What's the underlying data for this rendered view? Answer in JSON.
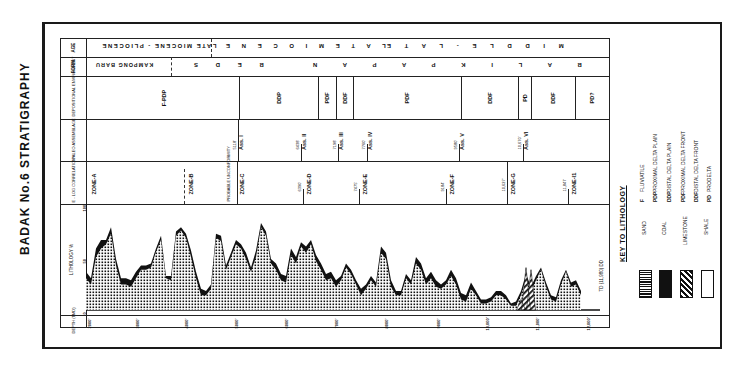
{
  "title": "BADAK No.6 STRATIGRAPHY",
  "row_headers": {
    "age": "AGE",
    "form": "FORM",
    "dep_env": "DEPOSITIONAL ENVIRONMENT",
    "paleo": "PALEO ASSEMBLAGE",
    "elog": "E - LOG CORRELATION",
    "lithology": "LITHOLOGY %",
    "depth": "DEPTH (TMD)"
  },
  "age_row": {
    "pliocene": "LATE MIOCENE - PLIOCENE",
    "late_miocene": "L A T E   M I O C E N E",
    "middle_late_miocene": "M I D D L E  -  L A T E"
  },
  "form_row": {
    "kampong_baru": "KAMPONG BARU",
    "beds": "B  E  D  S",
    "balikpapan": "B A L I K P A P A N"
  },
  "dep_env": [
    {
      "label": "F-PDP"
    },
    {
      "label": "DDP"
    },
    {
      "label": "PDF"
    },
    {
      "label": "DDF"
    },
    {
      "label": "PDF"
    },
    {
      "label": "DDF"
    },
    {
      "label": "PD"
    },
    {
      "label": "DDF"
    },
    {
      "label": "PD?"
    }
  ],
  "paleo": [
    {
      "depth": "5118'",
      "label": "Ass. I"
    },
    {
      "depth": "6438'",
      "label": "Ass. II"
    },
    {
      "depth": "7198'",
      "label": "Ass. III"
    },
    {
      "depth": "7760'",
      "label": "Ass. IV"
    },
    {
      "depth": "9580'",
      "label": "Ass. V"
    },
    {
      "depth": "10,670'",
      "label": "Ass. VI"
    }
  ],
  "zones": [
    {
      "depth": "",
      "label": "ZONE-A"
    },
    {
      "depth": "",
      "label": "ZONE-B"
    },
    {
      "depth": "PROBABLE UNCONFORMITY",
      "label": "ZONE-C"
    },
    {
      "depth": "6390'",
      "label": "ZONE-D"
    },
    {
      "depth": "7475'",
      "label": "ZONE-E"
    },
    {
      "depth": "9184'",
      "label": "ZONE-F"
    },
    {
      "depth": "10,627'",
      "label": "ZONE-G"
    },
    {
      "depth": "11,847'",
      "label": "ZONE-I1"
    }
  ],
  "lith_axis": {
    "top": "100",
    "mid": "50",
    "bottom": "0"
  },
  "depth_ticks": [
    "2000'",
    "3000'",
    "4000'",
    "5000'",
    "6000'",
    "7000'",
    "8000'",
    "9000'",
    "10,000'",
    "11,000'",
    "12,000'"
  ],
  "td_label": "TD (11,980) DD",
  "legend": {
    "title": "KEY TO LITHOLOGY",
    "items": [
      {
        "label": "SAND",
        "pattern": "dots"
      },
      {
        "label": "COAL",
        "pattern": "solid"
      },
      {
        "label": "LIMESTONE",
        "pattern": "hatch"
      },
      {
        "label": "SHALE",
        "pattern": "blank"
      }
    ],
    "abbrev": [
      {
        "code": "F",
        "meaning": "FLUVIATILE"
      },
      {
        "code": "PDP",
        "meaning": "PROXIMAL DELTA PLAIN"
      },
      {
        "code": "DDP",
        "meaning": "DISTAL DELTA PLAIN"
      },
      {
        "code": "PDF",
        "meaning": "PROXIMAL DELTA FRONT"
      },
      {
        "code": "DDF",
        "meaning": "DISTAL DELTA FRONT"
      },
      {
        "code": "PD",
        "meaning": "PRODELTA"
      }
    ]
  },
  "chart_data": {
    "type": "area",
    "xlabel": "DEPTH (TMD)",
    "ylabel": "LITHOLOGY %",
    "ylim": [
      0,
      100
    ],
    "x": [
      2000,
      2100,
      2200,
      2300,
      2400,
      2500,
      2600,
      2700,
      2800,
      2900,
      3000,
      3100,
      3200,
      3300,
      3400,
      3500,
      3600,
      3700,
      3800,
      3900,
      4000,
      4100,
      4200,
      4300,
      4400,
      4500,
      4600,
      4700,
      4800,
      4900,
      5000,
      5100,
      5200,
      5300,
      5400,
      5500,
      5600,
      5700,
      5800,
      5900,
      6000,
      6100,
      6200,
      6300,
      6400,
      6500,
      6600,
      6700,
      6800,
      6900,
      7000,
      7100,
      7200,
      7300,
      7400,
      7500,
      7600,
      7700,
      7800,
      7900,
      8000,
      8100,
      8200,
      8300,
      8400,
      8500,
      8600,
      8700,
      8800,
      8900,
      9000,
      9100,
      9200,
      9300,
      9400,
      9500,
      9600,
      9700,
      9800,
      9900,
      10000,
      10100,
      10200,
      10300,
      10400,
      10500,
      10600,
      10700,
      10800,
      10900,
      11000,
      11100,
      11200,
      11300,
      11400,
      11500,
      11600,
      11700,
      11800,
      11900
    ],
    "series": [
      {
        "name": "Sand (top)",
        "values": [
          30,
          24,
          50,
          58,
          62,
          72,
          42,
          24,
          24,
          22,
          30,
          38,
          38,
          40,
          55,
          66,
          30,
          28,
          70,
          75,
          68,
          50,
          30,
          14,
          14,
          20,
          68,
          65,
          38,
          50,
          62,
          58,
          48,
          36,
          50,
          78,
          70,
          44,
          38,
          28,
          26,
          52,
          44,
          60,
          54,
          62,
          46,
          38,
          28,
          30,
          22,
          28,
          40,
          34,
          24,
          14,
          20,
          28,
          22,
          54,
          48,
          22,
          14,
          14,
          30,
          24,
          44,
          38,
          24,
          30,
          22,
          20,
          24,
          32,
          24,
          10,
          8,
          20,
          14,
          6,
          6,
          8,
          14,
          14,
          10,
          4,
          4,
          14,
          30,
          18,
          28,
          38,
          22,
          10,
          8,
          24,
          36,
          22,
          24,
          14
        ]
      },
      {
        "name": "Coal (top)",
        "values": [
          36,
          30,
          58,
          66,
          66,
          78,
          48,
          30,
          30,
          28,
          36,
          42,
          42,
          44,
          58,
          70,
          32,
          32,
          74,
          78,
          72,
          56,
          36,
          20,
          18,
          24,
          72,
          70,
          42,
          54,
          66,
          62,
          54,
          40,
          56,
          82,
          74,
          48,
          44,
          34,
          32,
          58,
          50,
          64,
          60,
          66,
          52,
          44,
          34,
          36,
          28,
          32,
          44,
          38,
          28,
          20,
          24,
          32,
          26,
          60,
          54,
          28,
          18,
          18,
          34,
          28,
          50,
          44,
          30,
          36,
          28,
          24,
          28,
          38,
          30,
          16,
          14,
          26,
          18,
          10,
          10,
          12,
          18,
          18,
          14,
          6,
          8,
          18,
          34,
          22,
          32,
          40,
          26,
          14,
          12,
          28,
          38,
          26,
          28,
          18
        ]
      },
      {
        "name": "Limestone",
        "values": [
          0,
          0,
          0,
          0,
          0,
          0,
          0,
          0,
          0,
          0,
          0,
          0,
          0,
          0,
          0,
          0,
          0,
          0,
          0,
          0,
          0,
          0,
          0,
          0,
          0,
          0,
          0,
          0,
          0,
          0,
          0,
          0,
          0,
          0,
          0,
          0,
          0,
          0,
          0,
          0,
          0,
          0,
          0,
          0,
          0,
          0,
          0,
          0,
          0,
          0,
          0,
          0,
          0,
          0,
          0,
          0,
          0,
          0,
          0,
          0,
          0,
          0,
          0,
          0,
          0,
          0,
          0,
          0,
          0,
          0,
          0,
          0,
          0,
          0,
          0,
          0,
          0,
          0,
          0,
          0,
          0,
          0,
          0,
          0,
          0,
          0,
          0,
          10,
          40,
          38,
          0,
          0,
          0,
          0,
          0,
          0,
          0,
          0,
          0,
          0
        ]
      }
    ]
  }
}
